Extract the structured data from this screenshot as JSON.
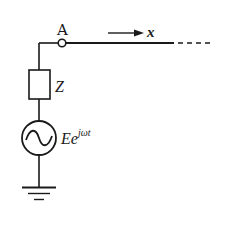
{
  "diagram": {
    "type": "circuit",
    "node_label": "A",
    "direction_label": "x",
    "impedance_label": "Z",
    "source_label": {
      "base": "Ee",
      "superscript": "jωt"
    },
    "components": [
      {
        "id": "node-A",
        "kind": "terminal"
      },
      {
        "id": "line",
        "kind": "transmission-line",
        "extends": "to infinity (dashed)"
      },
      {
        "id": "Z",
        "kind": "impedance"
      },
      {
        "id": "source",
        "kind": "ac-voltage-source"
      },
      {
        "id": "ground",
        "kind": "ground"
      }
    ],
    "colors": {
      "stroke": "#1a1a1a",
      "background": "#ffffff"
    }
  }
}
